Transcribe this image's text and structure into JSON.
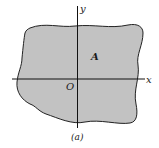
{
  "figure": {
    "region_label": "A",
    "origin_label": "O",
    "x_axis_label": "x",
    "y_axis_label": "y",
    "caption": "(a)",
    "colors": {
      "region_fill": "#c2c2c2",
      "outline": "#222222",
      "background": "#ffffff"
    }
  }
}
